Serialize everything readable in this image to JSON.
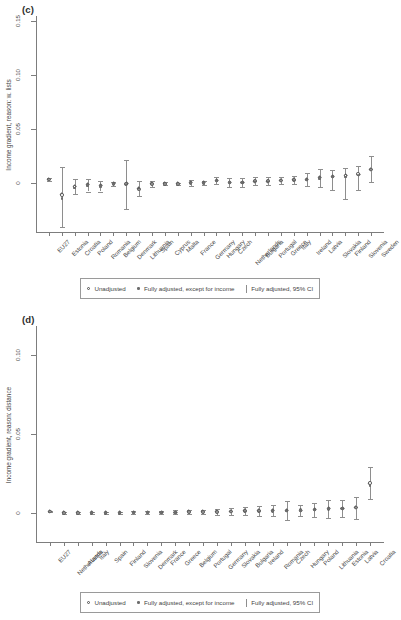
{
  "figure": {
    "panels": [
      {
        "label": "(c)",
        "ylabel": "Income gradient, reason: w. lists",
        "yticks": [
          "0",
          "0.05",
          "0.10",
          "0.15"
        ],
        "ylim": [
          -0.045,
          0.155
        ],
        "legend": {
          "unadjusted": "Unadjusted",
          "partial": "Fully adjusted, except for income",
          "full": "Fully adjusted, 95% CI"
        }
      },
      {
        "label": "(d)",
        "ylabel": "Income gradient, reason: distance",
        "yticks": [
          "0",
          "0.05",
          "0.10"
        ],
        "ylim": [
          -0.018,
          0.118
        ],
        "legend": {
          "unadjusted": "Unadjusted",
          "partial": "Fully adjusted, except for income",
          "full": "Fully adjusted, 95% CI"
        }
      }
    ]
  },
  "chart_data": [
    {
      "type": "scatter",
      "title": "(c)",
      "xlabel": "",
      "ylabel": "Income gradient, reason: w. lists",
      "ylim": [
        -0.045,
        0.155
      ],
      "yticks": [
        0,
        0.05,
        0.1,
        0.15
      ],
      "grid": false,
      "legend_position": "bottom",
      "categories": [
        "EU27",
        "Estonia",
        "Croatia",
        "Poland",
        "Romania",
        "Belgium",
        "Denmark",
        "Lithuania",
        "Spain",
        "Cyprus",
        "Malta",
        "France",
        "Germany",
        "Hungary",
        "Czech",
        "Netherlands",
        "Bulgaria",
        "Portugal",
        "Greece",
        "Italy",
        "Ireland",
        "Latvia",
        "Slovakia",
        "Finland",
        "Slovenia",
        "Sweden"
      ],
      "series": [
        {
          "name": "Unadjusted",
          "marker": "open-circle",
          "values": [
            0.0035,
            -0.0105,
            -0.0035,
            -0.0015,
            -0.0025,
            -0.0005,
            -0.0005,
            -0.0055,
            -0.0005,
            -0.0005,
            -0.0005,
            0.0005,
            0.0005,
            0.0025,
            0.001,
            0.001,
            0.002,
            0.002,
            0.0025,
            0.003,
            0.0035,
            0.005,
            0.0065,
            0.007,
            0.0085,
            0.013
          ]
        },
        {
          "name": "Fully adjusted, except for income",
          "marker": "dot",
          "values": [
            0.003,
            -0.014,
            -0.0045,
            -0.002,
            -0.003,
            -0.0008,
            -0.001,
            -0.006,
            -0.0008,
            -0.0006,
            -0.0005,
            0.0004,
            0.0004,
            0.002,
            0.0008,
            0.0008,
            0.0018,
            0.0018,
            0.0022,
            0.0028,
            0.003,
            0.0045,
            0.006,
            0.0062,
            0.008,
            0.0125
          ]
        },
        {
          "name": "Fully adjusted",
          "marker": "diamond",
          "values": [
            0.0035,
            -0.01,
            -0.0035,
            -0.0015,
            -0.0025,
            -0.0005,
            -0.0005,
            -0.005,
            -0.0005,
            -0.0005,
            -0.0005,
            0.0005,
            0.0005,
            0.0025,
            0.001,
            0.001,
            0.002,
            0.002,
            0.0025,
            0.003,
            0.0035,
            0.005,
            0.0065,
            0.007,
            0.0085,
            0.013
          ],
          "ci_low": [
            0.0018,
            -0.04,
            -0.01,
            -0.0075,
            -0.0075,
            -0.002,
            -0.024,
            -0.012,
            -0.003,
            -0.0018,
            -0.0012,
            -0.002,
            -0.0015,
            -0.001,
            -0.003,
            -0.0035,
            -0.0015,
            -0.0012,
            -0.001,
            -0.0005,
            -0.0025,
            -0.003,
            -0.0065,
            -0.014,
            -0.006,
            0.001
          ],
          "ci_high": [
            0.0052,
            0.015,
            0.004,
            0.0045,
            0.002,
            0.001,
            0.0215,
            0.0025,
            0.0025,
            0.001,
            0.0005,
            0.003,
            0.0025,
            0.0062,
            0.0048,
            0.005,
            0.0055,
            0.0055,
            0.006,
            0.0065,
            0.0095,
            0.013,
            0.012,
            0.0145,
            0.016,
            0.025
          ]
        }
      ]
    },
    {
      "type": "scatter",
      "title": "(d)",
      "xlabel": "",
      "ylabel": "Income gradient, reason: distance",
      "ylim": [
        -0.018,
        0.118
      ],
      "yticks": [
        0,
        0.05,
        0.1
      ],
      "grid": false,
      "legend_position": "bottom",
      "categories": [
        "EU27",
        "Netherlands",
        "Austria",
        "Italy",
        "Spain",
        "Finland",
        "Slovenia",
        "Denmark",
        "France",
        "Greece",
        "Belgium",
        "Portugal",
        "Germany",
        "Slovakia",
        "Bulgaria",
        "Ireland",
        "Romania",
        "Czech",
        "Hungary",
        "Poland",
        "Lithuania",
        "Estonia",
        "Latvia",
        "Croatia"
      ],
      "series": [
        {
          "name": "Unadjusted",
          "marker": "open-circle",
          "values": [
            0.0012,
            0.0002,
            0.0003,
            0.0003,
            0.0004,
            0.0004,
            0.0005,
            0.0006,
            0.0006,
            0.0007,
            0.0008,
            0.0009,
            0.001,
            0.0012,
            0.0014,
            0.0015,
            0.0016,
            0.0018,
            0.002,
            0.0024,
            0.0028,
            0.0032,
            0.0036,
            0.019
          ]
        },
        {
          "name": "Fully adjusted, except for income",
          "marker": "dot",
          "values": [
            0.001,
            0.0001,
            0.0002,
            0.0002,
            0.0003,
            0.0003,
            0.0004,
            0.0005,
            0.0005,
            0.0006,
            0.0007,
            0.0008,
            0.0009,
            0.001,
            0.0012,
            0.0013,
            0.0014,
            0.0016,
            0.0018,
            0.0022,
            0.0026,
            0.003,
            0.0034,
            0.0175
          ]
        },
        {
          "name": "Fully adjusted",
          "marker": "diamond",
          "values": [
            0.0012,
            0.0002,
            0.0003,
            0.0003,
            0.0004,
            0.0004,
            0.0005,
            0.0006,
            0.0006,
            0.0007,
            0.0008,
            0.0009,
            0.001,
            0.0012,
            0.0014,
            0.0015,
            0.0016,
            0.0018,
            0.002,
            0.0024,
            0.0028,
            0.0032,
            0.0036,
            0.019
          ],
          "ci_low": [
            0.0006,
            -0.0003,
            -0.0002,
            -0.0002,
            -0.0002,
            -0.0003,
            -0.0003,
            -0.0004,
            -0.0004,
            -0.0005,
            -0.0006,
            -0.0006,
            -0.0008,
            -0.001,
            -0.0012,
            -0.0014,
            -0.0018,
            -0.004,
            -0.0016,
            -0.002,
            -0.003,
            -0.0022,
            -0.0034,
            0.009
          ],
          "ci_high": [
            0.0018,
            0.0007,
            0.0008,
            0.0009,
            0.001,
            0.0011,
            0.0013,
            0.0016,
            0.0016,
            0.0019,
            0.0022,
            0.0024,
            0.0028,
            0.0034,
            0.004,
            0.0044,
            0.005,
            0.0076,
            0.0056,
            0.0068,
            0.0086,
            0.0086,
            0.0106,
            0.029
          ]
        }
      ]
    }
  ]
}
